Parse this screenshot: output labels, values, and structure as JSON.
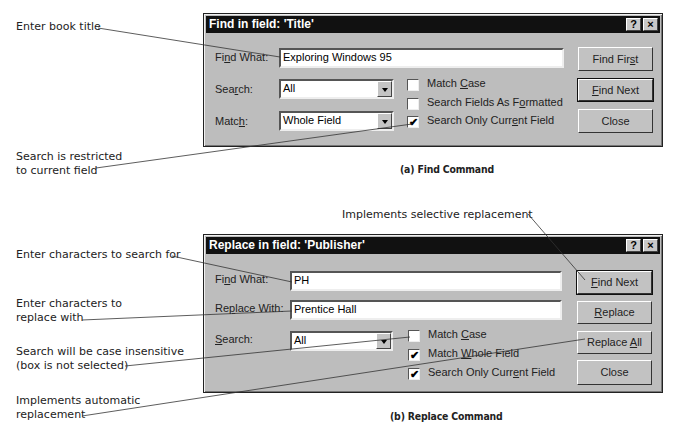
{
  "find_dialog": {
    "title": "Find in field: 'Title'",
    "help_button": "?",
    "close_button": "×",
    "find_what_label": "Find What:",
    "find_what_value": "Exploring Windows 95",
    "search_label": "Search:",
    "search_value": "All",
    "match_label": "Match:",
    "match_value": "Whole Field",
    "checkboxes": [
      {
        "label": "Match Case",
        "checked": false
      },
      {
        "label": "Search Fields As Formatted",
        "checked": false
      },
      {
        "label": "Search Only Current Field",
        "checked": true
      }
    ],
    "buttons": {
      "find_first": "Find First",
      "find_next": "Find Next",
      "close": "Close"
    },
    "caption": "(a) Find Command"
  },
  "replace_dialog": {
    "title": "Replace in field: 'Publisher'",
    "help_button": "?",
    "close_button": "×",
    "find_what_label": "Find What:",
    "find_what_value": "PH",
    "replace_with_label": "Replace With:",
    "replace_with_value": "Prentice Hall",
    "search_label": "Search:",
    "search_value": "All",
    "checkboxes": [
      {
        "label": "Match Case",
        "checked": false
      },
      {
        "label": "Match Whole Field",
        "checked": true
      },
      {
        "label": "Search Only Current Field",
        "checked": true
      }
    ],
    "buttons": {
      "find_next": "Find Next",
      "replace": "Replace",
      "replace_all": "Replace All",
      "close": "Close"
    },
    "caption": "(b) Replace Command"
  },
  "annotations": {
    "book_title": "Enter book title",
    "restricted": "Search is restricted\nto current field",
    "selective": "Implements selective replacement",
    "search_for": "Enter characters to search for",
    "replace_with": "Enter characters to\nreplace with",
    "case_insensitive": "Search will be case insensitive\n(box is not selected)",
    "automatic": "Implements automatic\nreplacement"
  },
  "check_glyph": "✔"
}
